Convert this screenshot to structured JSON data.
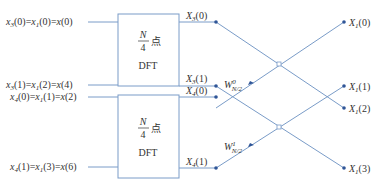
{
  "colors": {
    "line": "#7a9cc8",
    "dot": "#2f5597",
    "box": "#7a9cc8",
    "text": "#333333"
  },
  "inputs": [
    {
      "label_a": "x",
      "sub_a": "3",
      "arg_a": "(0)",
      "label_b": "x",
      "sub_b": "1",
      "arg_b": "(0)",
      "label_c": "x",
      "arg_c": "(0)"
    },
    {
      "label_a": "x",
      "sub_a": "3",
      "arg_a": "(1)",
      "label_b": "x",
      "sub_b": "1",
      "arg_b": "(2)",
      "label_c": "x",
      "arg_c": "(4)"
    },
    {
      "label_a": "x",
      "sub_a": "4",
      "arg_a": "(0)",
      "label_b": "x",
      "sub_b": "1",
      "arg_b": "(1)",
      "label_c": "x",
      "arg_c": "(2)"
    },
    {
      "label_a": "x",
      "sub_a": "4",
      "arg_a": "(1)",
      "label_b": "x",
      "sub_b": "1",
      "arg_b": "(3)",
      "label_c": "x",
      "arg_c": "(6)"
    }
  ],
  "boxes": [
    {
      "numerator": "N",
      "denominator": "4",
      "unit": "点",
      "name": "DFT"
    },
    {
      "numerator": "N",
      "denominator": "4",
      "unit": "点",
      "name": "DFT"
    }
  ],
  "intermediate": [
    {
      "sym": "X",
      "sub": "3",
      "arg": "(0)"
    },
    {
      "sym": "X",
      "sub": "3",
      "arg": "(1)"
    },
    {
      "sym": "X",
      "sub": "4",
      "arg": "(0)"
    },
    {
      "sym": "X",
      "sub": "4",
      "arg": "(1)"
    }
  ],
  "twiddles": [
    {
      "sym": "W",
      "sup": "0",
      "sub": "N/2"
    },
    {
      "sym": "W",
      "sup": "1",
      "sub": "N/2"
    }
  ],
  "outputs": [
    {
      "sym": "X",
      "sub": "1",
      "arg": "(0)"
    },
    {
      "sym": "X",
      "sub": "1",
      "arg": "(1)"
    },
    {
      "sym": "X",
      "sub": "1",
      "arg": "(2)"
    },
    {
      "sym": "X",
      "sub": "1",
      "arg": "(3)"
    }
  ],
  "equals": "="
}
